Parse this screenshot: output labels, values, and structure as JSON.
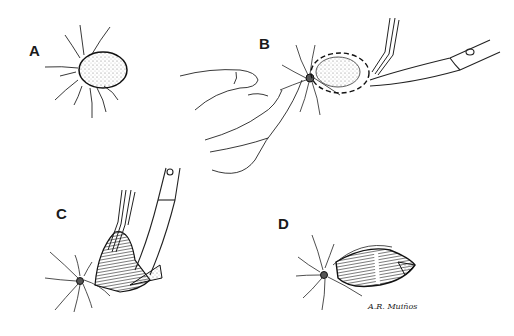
{
  "figure": {
    "type": "surgical-technique-illustration",
    "panels": [
      {
        "label": "A",
        "description": "Elliptical lesion with radiating hairs/lines"
      },
      {
        "label": "B",
        "description": "Fingers retracting skin while forceps and curved scissors excise lesion along dashed outline"
      },
      {
        "label": "C",
        "description": "Forceps lifting excised tissue while scissors undermine the base"
      },
      {
        "label": "D",
        "description": "Resulting elliptical defect after excision"
      }
    ],
    "signature": "A.R. Muiños"
  }
}
